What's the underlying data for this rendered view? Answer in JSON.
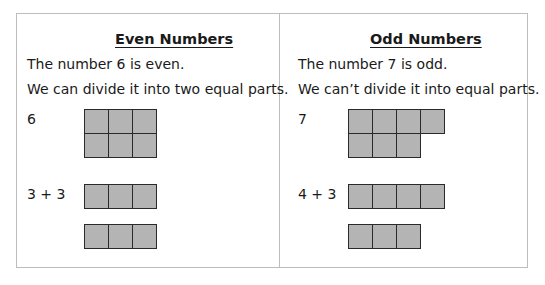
{
  "even": {
    "title": "Even Numbers",
    "line1": "The number 6 is even.",
    "line2": "We can divide it into two equal parts.",
    "number_label": "6",
    "sum_label": "3 + 3",
    "grid_rows": [
      3,
      3
    ],
    "parts": [
      3,
      3
    ]
  },
  "odd": {
    "title": "Odd Numbers",
    "line1": "The number 7 is odd.",
    "line2": "We can’t divide it into equal parts.",
    "number_label": "7",
    "sum_label": "4 + 3",
    "grid_rows": [
      4,
      3
    ],
    "parts": [
      4,
      3
    ]
  },
  "colors": {
    "cell_fill": "#b4b4b4",
    "cell_border": "#2a2a2a",
    "frame": "#bdbdbd"
  }
}
